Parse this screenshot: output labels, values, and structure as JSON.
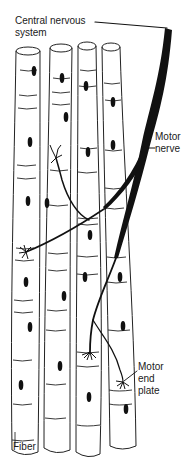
{
  "diagram": {
    "labels": {
      "cns_line1": "Central nervous",
      "cns_line2": "system",
      "motor_nerve_line1": "Motor",
      "motor_nerve_line2": "nerve",
      "end_plate_line1": "Motor",
      "end_plate_line2": "end",
      "end_plate_line3": "plate",
      "fiber": "Fiber"
    },
    "fiber_count": 4,
    "colors": {
      "background": "#ffffff",
      "ink": "#111111"
    }
  }
}
